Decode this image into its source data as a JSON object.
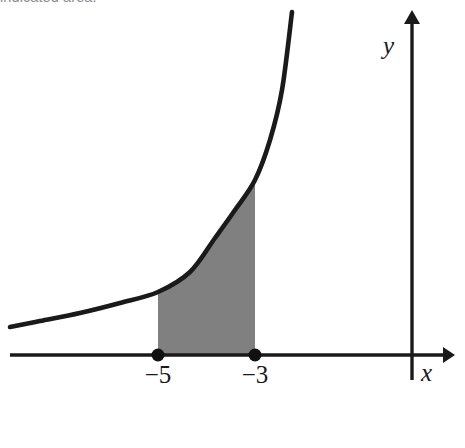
{
  "figure": {
    "caption_clipped": "indicated area.",
    "background_color": "#ffffff",
    "stroke_color": "#1a1a1a",
    "shade_color": "#808080",
    "width": 465,
    "height": 448
  },
  "axes": {
    "x_label": "x",
    "y_label": "y",
    "x_axis_line": "M10,355 L443,355",
    "y_axis_line": "M412,380 L412,22",
    "x_arrow": "M443,347 L455,355 L443,363 Z",
    "y_arrow": "M404,24 L412,10 L420,24 Z",
    "x_label_pos": {
      "x": 421,
      "y": 381
    },
    "y_label_pos": {
      "x": 383,
      "y": 54
    }
  },
  "ticks": [
    {
      "label": "−5",
      "x": 158,
      "label_y": 383,
      "dot_y": 355,
      "dot_r": 6.5
    },
    {
      "label": "−3",
      "x": 255,
      "label_y": 383,
      "dot_y": 355,
      "dot_r": 6.5
    }
  ],
  "chart_data": {
    "type": "area",
    "title": "",
    "subtitle": "",
    "xlabel": "x",
    "ylabel": "y",
    "grid": false,
    "legend": null,
    "annotations": [
      {
        "text": "−5",
        "x": -5,
        "y": 0,
        "role": "lower-limit-of-integration"
      },
      {
        "text": "−3",
        "x": -3,
        "y": 0,
        "role": "upper-limit-of-integration"
      }
    ],
    "series": [
      {
        "name": "curve",
        "kind": "exponential-increasing",
        "stroke": "#1a1a1a",
        "points_px": [
          [
            10,
            327
          ],
          [
            40,
            321
          ],
          [
            80,
            313
          ],
          [
            120,
            303
          ],
          [
            158,
            292
          ],
          [
            190,
            272
          ],
          [
            215,
            238
          ],
          [
            235,
            210
          ],
          [
            255,
            180
          ],
          [
            270,
            140
          ],
          [
            282,
            90
          ],
          [
            292,
            12
          ]
        ]
      },
      {
        "name": "shaded-region",
        "kind": "area-under-curve",
        "fill": "#808080",
        "x_from": -5,
        "x_to": -3,
        "x_from_px": 158,
        "x_to_px": 255,
        "baseline_px": 355
      }
    ],
    "axis_ranges": {
      "x_axis_y_px": 355,
      "y_axis_x_px": 412
    }
  }
}
